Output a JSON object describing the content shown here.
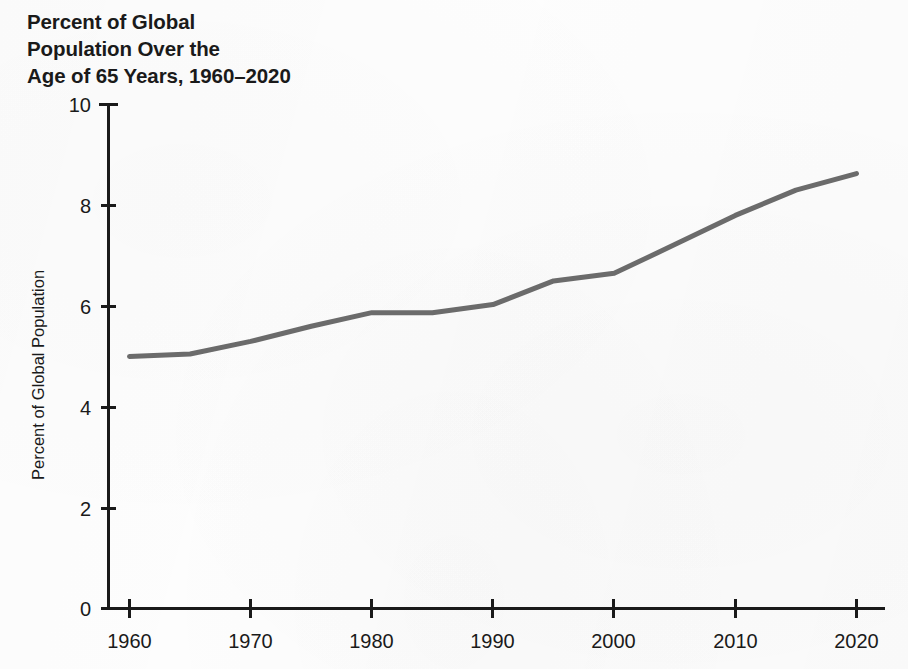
{
  "chart_data": {
    "type": "line",
    "title_lines": [
      "Percent of Global",
      "Population Over the",
      "Age of 65 Years, 1960–2020"
    ],
    "xlabel": "",
    "ylabel": "Percent of Global Population",
    "xlim": [
      1960,
      2020
    ],
    "ylim": [
      0,
      10
    ],
    "grid": false,
    "legend": false,
    "x": [
      1960,
      1965,
      1970,
      1975,
      1980,
      1985,
      1990,
      1995,
      2000,
      2005,
      2010,
      2015,
      2020
    ],
    "values": [
      5.0,
      5.05,
      5.3,
      5.6,
      5.87,
      5.87,
      6.03,
      6.5,
      6.65,
      7.22,
      7.8,
      8.3,
      8.63
    ],
    "series": [
      {
        "name": "Percent of Global Population Over the Age of 65 Years",
        "values": [
          5.0,
          5.05,
          5.3,
          5.6,
          5.87,
          5.87,
          6.03,
          6.5,
          6.65,
          7.22,
          7.8,
          8.3,
          8.63
        ]
      }
    ],
    "xticks": [
      1960,
      1970,
      1980,
      1990,
      2000,
      2010,
      2020
    ],
    "xtick_labels": [
      "1960",
      "1970",
      "1980",
      "1990",
      "2000",
      "2010",
      "2020"
    ],
    "yticks": [
      0,
      2,
      4,
      6,
      8,
      10
    ],
    "ytick_labels": [
      "0",
      "2",
      "4",
      "6",
      "8",
      "10"
    ],
    "line_color": "#6b6b6b",
    "axis_color": "#1a1a1a",
    "background_color": "#fdfdfd"
  },
  "axis": {
    "y_title": "Percent of Global Population",
    "x_title": ""
  },
  "ytick_labels": {
    "t0": "0",
    "t1": "2",
    "t2": "4",
    "t3": "6",
    "t4": "8",
    "t5": "10"
  },
  "xtick_labels": {
    "t0": "1960",
    "t1": "1970",
    "t2": "1980",
    "t3": "1990",
    "t4": "2000",
    "t5": "2010",
    "t6": "2020"
  },
  "title": {
    "line1": "Percent of Global",
    "line2": "Population Over the",
    "line3": "Age of 65 Years, 1960–2020"
  }
}
